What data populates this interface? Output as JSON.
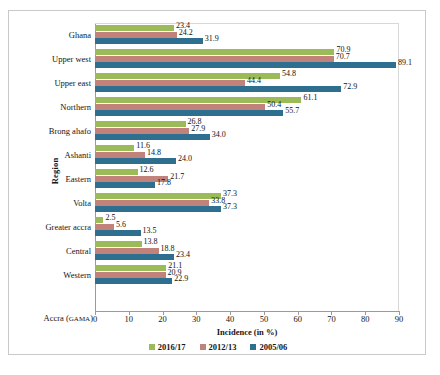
{
  "chart_data": {
    "type": "bar",
    "orientation": "horizontal",
    "title": "",
    "xlabel": "Incidence (in %)",
    "ylabel": "Region",
    "xlim": [
      0,
      90
    ],
    "xticks": [
      0,
      10,
      20,
      30,
      40,
      50,
      60,
      70,
      80,
      90
    ],
    "grid": false,
    "legend_position": "bottom",
    "categories": [
      "Ghana",
      "Upper west",
      "Upper east",
      "Northern",
      "Brong ahafo",
      "Ashanti",
      "Eastern",
      "Volta",
      "Greater accra",
      "Central",
      "Western",
      "Accra (GAMA)"
    ],
    "series": [
      {
        "name": "2016/17",
        "color": "#9BBB59",
        "values": [
          23.4,
          70.9,
          54.8,
          61.1,
          26.8,
          11.6,
          12.6,
          37.3,
          2.5,
          13.8,
          21.1,
          null
        ]
      },
      {
        "name": "2012/13",
        "color": "#C0827A",
        "values": [
          24.2,
          70.7,
          44.4,
          50.4,
          27.9,
          14.8,
          21.7,
          33.8,
          5.6,
          18.8,
          20.9,
          null
        ]
      },
      {
        "name": "2005/06",
        "color": "#2E6E8E",
        "values": [
          31.9,
          89.1,
          72.9,
          55.7,
          34.0,
          24.0,
          17.8,
          37.3,
          13.5,
          23.4,
          22.9,
          null
        ]
      }
    ]
  },
  "axis": {
    "x_label": "Incidence (in %)",
    "y_label": "Region",
    "tick_labels": [
      "0",
      "10",
      "20",
      "30",
      "40",
      "50",
      "60",
      "70",
      "80",
      "90"
    ]
  },
  "accra_label": {
    "prefix": "Accra (",
    "smallcaps": "GAMA",
    "suffix": ")"
  },
  "legend": {
    "items": [
      {
        "label": "2016/17",
        "color": "#9BBB59"
      },
      {
        "label": "2012/13",
        "color": "#C0827A"
      },
      {
        "label": "2005/06",
        "color": "#2E6E8E"
      }
    ]
  }
}
